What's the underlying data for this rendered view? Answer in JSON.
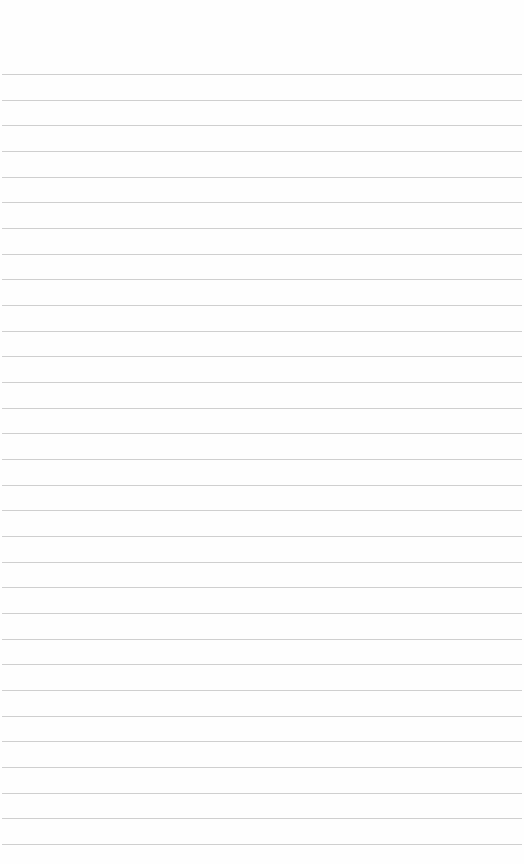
{
  "paper": {
    "type": "lined-notebook-page",
    "background": "#fefefe",
    "line_color": "#cfcfcf",
    "first_line_y": 74,
    "line_spacing": 25.67,
    "line_count": 31
  }
}
